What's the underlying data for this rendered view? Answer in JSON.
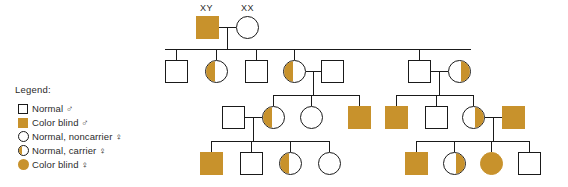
{
  "diagram": {
    "type": "pedigree-chart",
    "colors": {
      "affected_fill": "#c8922c",
      "unaffected_fill": "#ffffff",
      "line": "#1a1a1a",
      "background": "#ffffff"
    }
  },
  "legend": {
    "title": "Legend:",
    "items": [
      {
        "key": "square-open",
        "label": "Normal ♂"
      },
      {
        "key": "square-filled",
        "label": "Color blind ♂"
      },
      {
        "key": "circle-open",
        "label": "Normal, noncarrier ♀"
      },
      {
        "key": "circle-half",
        "label": "Normal, carrier ♀"
      },
      {
        "key": "circle-filled",
        "label": "Color blind ♀"
      }
    ]
  },
  "genotype_labels": {
    "founder_male": "XY",
    "founder_female": "XX"
  },
  "generations": [
    {
      "id": "I",
      "individuals": [
        {
          "id": "I-1",
          "sex": "male",
          "symbol": "square-filled",
          "status": "color-blind",
          "genotype": "XY"
        },
        {
          "id": "I-2",
          "sex": "female",
          "symbol": "circle-open",
          "status": "normal-noncarrier",
          "genotype": "XX"
        }
      ]
    },
    {
      "id": "II",
      "individuals": [
        {
          "id": "II-1",
          "sex": "male",
          "symbol": "square-open",
          "status": "normal"
        },
        {
          "id": "II-2",
          "sex": "female",
          "symbol": "circle-half-left",
          "status": "normal-carrier"
        },
        {
          "id": "II-3",
          "sex": "male",
          "symbol": "square-open",
          "status": "normal"
        },
        {
          "id": "II-4",
          "sex": "female",
          "symbol": "circle-half-left",
          "status": "normal-carrier"
        },
        {
          "id": "II-5",
          "sex": "male",
          "symbol": "square-open",
          "status": "normal"
        },
        {
          "id": "II-6",
          "sex": "male",
          "symbol": "square-open",
          "status": "normal"
        },
        {
          "id": "II-7",
          "sex": "female",
          "symbol": "circle-half-right",
          "status": "normal-carrier"
        }
      ]
    },
    {
      "id": "III",
      "individuals": [
        {
          "id": "III-1",
          "sex": "male",
          "symbol": "square-open",
          "status": "normal"
        },
        {
          "id": "III-2",
          "sex": "female",
          "symbol": "circle-half-left",
          "status": "normal-carrier"
        },
        {
          "id": "III-3",
          "sex": "female",
          "symbol": "circle-open",
          "status": "normal-noncarrier"
        },
        {
          "id": "III-4",
          "sex": "male",
          "symbol": "square-filled",
          "status": "color-blind"
        },
        {
          "id": "III-5",
          "sex": "male",
          "symbol": "square-filled",
          "status": "color-blind"
        },
        {
          "id": "III-6",
          "sex": "male",
          "symbol": "square-open",
          "status": "normal"
        },
        {
          "id": "III-7",
          "sex": "female",
          "symbol": "circle-half-right",
          "status": "normal-carrier"
        },
        {
          "id": "III-8",
          "sex": "male",
          "symbol": "square-filled",
          "status": "color-blind"
        }
      ]
    },
    {
      "id": "IV",
      "individuals": [
        {
          "id": "IV-1",
          "sex": "male",
          "symbol": "square-filled",
          "status": "color-blind"
        },
        {
          "id": "IV-2",
          "sex": "male",
          "symbol": "square-open",
          "status": "normal"
        },
        {
          "id": "IV-3",
          "sex": "female",
          "symbol": "circle-half-left",
          "status": "normal-carrier"
        },
        {
          "id": "IV-4",
          "sex": "female",
          "symbol": "circle-open",
          "status": "normal-noncarrier"
        },
        {
          "id": "IV-5",
          "sex": "male",
          "symbol": "square-filled",
          "status": "color-blind"
        },
        {
          "id": "IV-6",
          "sex": "female",
          "symbol": "circle-half-right",
          "status": "normal-carrier"
        },
        {
          "id": "IV-7",
          "sex": "female",
          "symbol": "circle-filled",
          "status": "color-blind"
        },
        {
          "id": "IV-8",
          "sex": "male",
          "symbol": "square-open",
          "status": "normal"
        }
      ]
    }
  ]
}
